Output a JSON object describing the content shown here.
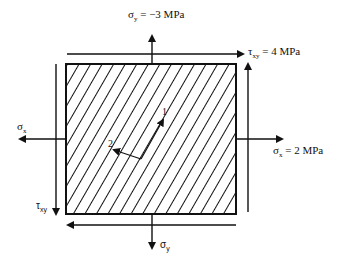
{
  "diagram": {
    "type": "plane-stress-element",
    "labels": {
      "sigma_y_top": {
        "symbol": "σ",
        "sub": "y",
        "value": " = −3 MPa"
      },
      "tau_xy_top": {
        "symbol": "τ",
        "sub": "xy",
        "value": " = 4 MPa"
      },
      "sigma_x_left": {
        "symbol": "σ",
        "sub": "x",
        "value": ""
      },
      "sigma_x_right": {
        "symbol": "σ",
        "sub": "x",
        "value": " = 2 MPa"
      },
      "tau_xy_left": {
        "symbol": "τ",
        "sub": "xy",
        "value": ""
      },
      "sigma_y_bottom": {
        "symbol": "σ",
        "sub": "y",
        "value": ""
      },
      "axis_1": "1",
      "axis_2": "2"
    },
    "colors": {
      "stroke": "#111111",
      "background": "#ffffff"
    }
  }
}
